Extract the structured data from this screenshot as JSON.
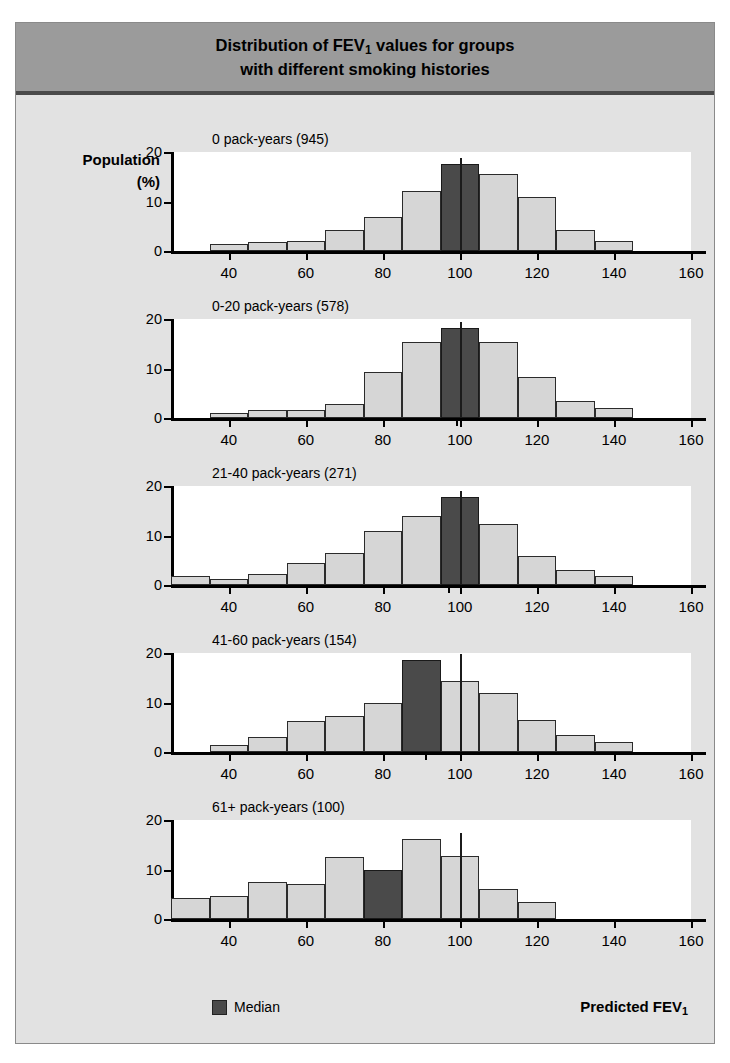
{
  "figure": {
    "title_line1": "Distribution of FEV₁ values for groups",
    "title_line2": "with different smoking histories",
    "title_plain": "Distribution of FEV1 values for groups with different smoking histories",
    "ylabel_line1": "Population",
    "ylabel_line2": "(%)",
    "xaxis_title": "Predicted FEV₁",
    "legend_label": "Median",
    "median_color": "#4a4a4a",
    "bar_color": "#d6d6d6",
    "header_band_color": "#9b9b9b",
    "body_color": "#e2e2e2"
  },
  "chart_data": {
    "type": "bar",
    "title": "Distribution of FEV1 values for groups with different smoking histories",
    "xlabel": "Predicted FEV1",
    "ylabel": "Population (%)",
    "xlim": [
      25,
      160
    ],
    "ylim": [
      0,
      20
    ],
    "yticks": [
      0,
      10,
      20
    ],
    "xticks": [
      40,
      60,
      80,
      100,
      120,
      140,
      160
    ],
    "grid": false,
    "legend": [
      "Median"
    ],
    "legend_position": "bottom-left",
    "bin_width": 10,
    "panels": [
      {
        "label": "0 pack-years (945)",
        "group": "0 pack-years",
        "n": 945,
        "bin_starts": [
          35,
          45,
          55,
          65,
          75,
          85,
          95,
          105,
          115,
          125,
          135
        ],
        "values": [
          1.5,
          1.9,
          2.1,
          4.2,
          6.8,
          12.2,
          17.5,
          15.5,
          10.9,
          4.3,
          2.1
        ],
        "median_bin_index": 6,
        "median": 100
      },
      {
        "label": "0-20 pack-years (578)",
        "group": "0-20 pack-years",
        "n": 578,
        "bin_starts": [
          35,
          45,
          55,
          65,
          75,
          85,
          95,
          105,
          115,
          125,
          135
        ],
        "values": [
          1.0,
          1.6,
          1.6,
          2.9,
          9.2,
          15.3,
          18.1,
          15.4,
          8.2,
          3.5,
          2.0
        ],
        "median_bin_index": 6,
        "median": 99
      },
      {
        "label": "21-40 pack-years (271)",
        "group": "21-40 pack-years",
        "n": 271,
        "bin_starts": [
          25,
          35,
          45,
          55,
          65,
          75,
          85,
          95,
          105,
          115,
          125,
          135
        ],
        "values": [
          1.8,
          1.2,
          2.3,
          4.5,
          6.4,
          10.9,
          13.9,
          17.8,
          12.3,
          5.9,
          3.0,
          1.9
        ],
        "median_bin_index": 7,
        "median": 97
      },
      {
        "label": "41-60 pack-years (154)",
        "group": "41-60 pack-years",
        "n": 154,
        "bin_starts": [
          35,
          45,
          55,
          65,
          75,
          85,
          95,
          105,
          115,
          125,
          135
        ],
        "values": [
          1.4,
          3.1,
          6.2,
          7.3,
          10.0,
          18.5,
          14.4,
          11.9,
          6.4,
          3.4,
          2.0
        ],
        "median_bin_index": 5,
        "median": 91
      },
      {
        "label": "61+ pack-years (100)",
        "group": "61+ pack-years",
        "n": 100,
        "bin_starts": [
          25,
          35,
          45,
          55,
          65,
          75,
          85,
          95,
          105,
          115
        ],
        "values": [
          4.2,
          4.7,
          7.4,
          7.0,
          12.6,
          10.0,
          16.2,
          12.8,
          6.1,
          3.5
        ],
        "median_bin_index": 5,
        "median": 80
      }
    ]
  }
}
